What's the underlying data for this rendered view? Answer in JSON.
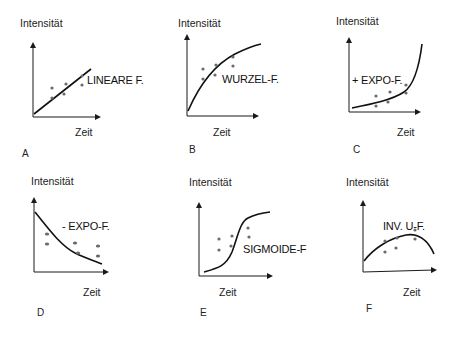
{
  "panels": [
    {
      "id": "A",
      "letter": "A",
      "ylabel": "Intensität",
      "xlabel": "Zeit",
      "curve_label": "LINEARE F.",
      "type": "linear"
    },
    {
      "id": "B",
      "letter": "B",
      "ylabel": "Intensität",
      "xlabel": "Zeit",
      "curve_label": "WURZEL-F.",
      "type": "square-root"
    },
    {
      "id": "C",
      "letter": "C",
      "ylabel": "Intensität",
      "xlabel": "Zeit",
      "curve_label": "+ EXPO-F.",
      "type": "positive-exponential"
    },
    {
      "id": "D",
      "letter": "D",
      "ylabel": "Intensität",
      "xlabel": "Zeit",
      "curve_label": "- EXPO-F.",
      "type": "negative-exponential"
    },
    {
      "id": "E",
      "letter": "E",
      "ylabel": "Intensität",
      "xlabel": "Zeit",
      "curve_label": "SIGMOIDE-F",
      "type": "sigmoid"
    },
    {
      "id": "F",
      "letter": "F",
      "ylabel": "Intensität",
      "xlabel": "Zeit",
      "curve_label": "INV. U-F.",
      "type": "inverted-u"
    }
  ],
  "colors": {
    "axis": "#1a1a1a",
    "curve": "#111111",
    "dots": "#6b6b6b"
  }
}
